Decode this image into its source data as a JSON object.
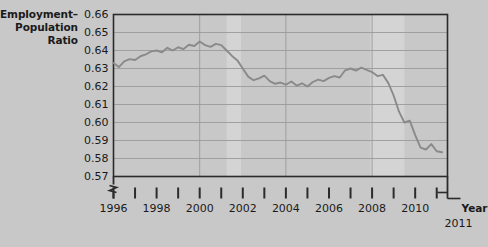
{
  "chart_data": {
    "type": "line",
    "title": "",
    "ylabel": "Employment–\nPopulation\nRatio",
    "ylabel_lines": [
      "Employment–",
      "Population",
      "Ratio"
    ],
    "xlabel": "Year",
    "x_end_label": "2011",
    "ylim": [
      0.57,
      0.66
    ],
    "xlim": [
      1996,
      2011.5
    ],
    "y_axis_break": true,
    "grid": true,
    "legend": false,
    "yticks": [
      0.66,
      0.65,
      0.64,
      0.63,
      0.62,
      0.61,
      0.6,
      0.59,
      0.58,
      0.57
    ],
    "ytick_labels": [
      "0.66",
      "0.65",
      "0.64",
      "0.63",
      "0.62",
      "0.61",
      "0.60",
      "0.59",
      "0.58",
      "0.57"
    ],
    "xticks": [
      1996,
      1997,
      1998,
      1999,
      2000,
      2001,
      2002,
      2003,
      2004,
      2005,
      2006,
      2007,
      2008,
      2009,
      2010,
      2011
    ],
    "xtick_labels": [
      "1996",
      "",
      "1998",
      "",
      "2000",
      "",
      "2002",
      "",
      "2004",
      "",
      "2006",
      "",
      "2008",
      "",
      "2010",
      ""
    ],
    "shaded_regions": [
      {
        "name": "recession-2001",
        "x_start": 2001.25,
        "x_end": 2001.92
      },
      {
        "name": "recession-2008",
        "x_start": 2007.92,
        "x_end": 2009.5
      }
    ],
    "series": [
      {
        "name": "Employment-Population Ratio",
        "color": "#8a8a8a",
        "x": [
          1996.0,
          1996.25,
          1996.5,
          1996.75,
          1997.0,
          1997.25,
          1997.5,
          1997.75,
          1998.0,
          1998.25,
          1998.5,
          1998.75,
          1999.0,
          1999.25,
          1999.5,
          1999.75,
          2000.0,
          2000.25,
          2000.5,
          2000.75,
          2001.0,
          2001.25,
          2001.5,
          2001.75,
          2002.0,
          2002.25,
          2002.5,
          2002.75,
          2003.0,
          2003.25,
          2003.5,
          2003.75,
          2004.0,
          2004.25,
          2004.5,
          2004.75,
          2005.0,
          2005.25,
          2005.5,
          2005.75,
          2006.0,
          2006.25,
          2006.5,
          2006.75,
          2007.0,
          2007.25,
          2007.5,
          2007.75,
          2008.0,
          2008.25,
          2008.5,
          2008.75,
          2009.0,
          2009.25,
          2009.5,
          2009.75,
          2010.0,
          2010.25,
          2010.5,
          2010.75,
          2011.0,
          2011.25
        ],
        "y": [
          0.633,
          0.6308,
          0.634,
          0.6352,
          0.6347,
          0.6368,
          0.6378,
          0.6395,
          0.64,
          0.639,
          0.6415,
          0.64,
          0.6418,
          0.6408,
          0.6432,
          0.6425,
          0.645,
          0.643,
          0.642,
          0.6437,
          0.643,
          0.64,
          0.637,
          0.6345,
          0.63,
          0.6255,
          0.6235,
          0.6245,
          0.626,
          0.623,
          0.6215,
          0.6222,
          0.621,
          0.6228,
          0.6205,
          0.6218,
          0.62,
          0.6225,
          0.6238,
          0.623,
          0.6248,
          0.6258,
          0.625,
          0.629,
          0.63,
          0.6288,
          0.6305,
          0.6292,
          0.628,
          0.6258,
          0.6265,
          0.622,
          0.615,
          0.606,
          0.6,
          0.601,
          0.593,
          0.586,
          0.585,
          0.588,
          0.584,
          0.5835
        ]
      }
    ]
  }
}
